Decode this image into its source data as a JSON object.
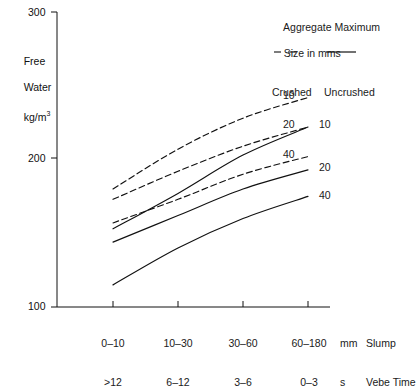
{
  "chart_data": {
    "type": "line",
    "title": "",
    "xlabel": "Slump / Vebe Time",
    "ylabel": "Free Water kg/m3",
    "ylim": [
      100,
      300
    ],
    "yticks": [
      100,
      200,
      300
    ],
    "ytick_labels": [
      "100",
      "200",
      "300"
    ],
    "grid": false,
    "legend_position": "top-right",
    "categories": [
      "0–10 / >12",
      "10–30 / 6–12",
      "30–60 / 3–6",
      "60–180 / 0–3"
    ],
    "x_indices": [
      0,
      1,
      2,
      3
    ],
    "series": [
      {
        "name": "Crushed 10",
        "aggregate_size_mm": 10,
        "aggregate_type": "Crushed",
        "style": "dashed",
        "end_label": "10",
        "values": [
          180,
          207,
          228,
          242
        ]
      },
      {
        "name": "Crushed 20",
        "aggregate_size_mm": 20,
        "aggregate_type": "Crushed",
        "style": "dashed",
        "end_label": "20",
        "values": [
          173,
          192,
          209,
          222
        ]
      },
      {
        "name": "Crushed 40",
        "aggregate_size_mm": 40,
        "aggregate_type": "Crushed",
        "style": "dashed",
        "end_label": "40",
        "values": [
          157,
          173,
          190,
          202
        ]
      },
      {
        "name": "Uncrushed 10",
        "aggregate_size_mm": 10,
        "aggregate_type": "Uncrushed",
        "style": "solid",
        "end_label": "10",
        "values": [
          153,
          177,
          203,
          222
        ]
      },
      {
        "name": "Uncrushed 20",
        "aggregate_size_mm": 20,
        "aggregate_type": "Uncrushed",
        "style": "solid",
        "end_label": "20",
        "values": [
          144,
          162,
          180,
          193
        ]
      },
      {
        "name": "Uncrushed 40",
        "aggregate_size_mm": 40,
        "aggregate_type": "Uncrushed",
        "style": "solid",
        "end_label": "40",
        "values": [
          115,
          140,
          160,
          175
        ]
      }
    ]
  },
  "axes": {
    "y": {
      "title_line1": "Free",
      "title_line2": "Water",
      "title_line3": "kg/m",
      "title_line3_sup": "3",
      "ticks": {
        "top": "300",
        "mid": "200",
        "bottom": "100"
      }
    },
    "x": {
      "categories": [
        {
          "slump": "0–10",
          "vebe": ">12"
        },
        {
          "slump": "10–30",
          "vebe": "6–12"
        },
        {
          "slump": "30–60",
          "vebe": "3–6"
        },
        {
          "slump": "60–180",
          "vebe": "0–3"
        }
      ],
      "units": {
        "slump": "mm",
        "vebe": "s"
      },
      "row_titles": {
        "slump": "Slump",
        "vebe": "Vebe Time"
      }
    }
  },
  "legend": {
    "title_line1": "Aggregate Maximum",
    "title_line2": "Size in mms",
    "crushed_label": "Crushed",
    "uncrushed_label": "Uncrushed"
  },
  "series_end_labels": {
    "crushed_10": "10",
    "crushed_20": "20",
    "crushed_40": "40",
    "uncrushed_10": "10",
    "uncrushed_20": "20",
    "uncrushed_40": "40"
  },
  "colors": {
    "ink": "#111111",
    "background": "#ffffff"
  }
}
